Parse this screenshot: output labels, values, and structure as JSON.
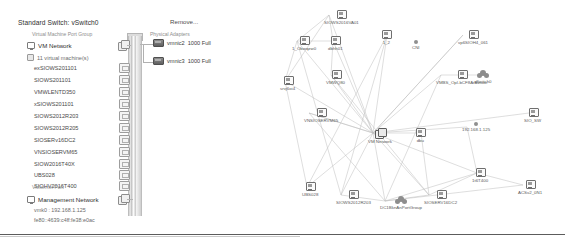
{
  "window": {
    "product": "vSphere Client Networking View"
  },
  "switch_panel": {
    "title": "Standard Switch: vSwitch0",
    "remove_label": "Remove...",
    "vm_port_group_caption": "Virtual Machine Port Group",
    "vmkernel_port_caption": "VMkernel Port",
    "physical_adapters_caption": "Physical Adapters",
    "port_groups": [
      {
        "name": "VM Network",
        "vm_count_label": "11 virtual machine(s)",
        "vms": [
          "exSIOWS201101",
          "SIOWS201101",
          "VMWLENTD350",
          "xSIOWS201101",
          "SIOWS2012R203",
          "SIOWS2012R205",
          "SIOSERv16DC2",
          "VNSIOSERVM65",
          "SIOW2016T40X",
          "UBS028",
          "SIOHV2016T400"
        ]
      }
    ],
    "vmkernel": {
      "name": "Management Network",
      "ipv4": "vmk0 : 192.168.1.125",
      "ipv6": "fe80::4639:c4ff:fe38:e0ac"
    },
    "physical_adapters": [
      {
        "name": "vmnic2",
        "speed": "1000 Full"
      },
      {
        "name": "vmnic3",
        "speed": "1000 Full"
      }
    ]
  },
  "network_map": {
    "nodes": [
      {
        "id": "n1",
        "label": "SIOWS2016VA01",
        "type": "vm",
        "x": 48,
        "y": 10
      },
      {
        "id": "n2",
        "label": "1_Obwqzw0",
        "type": "vm",
        "x": 16,
        "y": 36
      },
      {
        "id": "n3",
        "label": "dbhh01",
        "type": "vm",
        "x": 52,
        "y": 36
      },
      {
        "id": "n4",
        "label": "1_2",
        "type": "vm",
        "x": 106,
        "y": 30
      },
      {
        "id": "n5",
        "label": "CNI",
        "type": "dot",
        "x": 136,
        "y": 40
      },
      {
        "id": "n6",
        "label": "vp6SIOH4_061",
        "type": "vm",
        "x": 182,
        "y": 30
      },
      {
        "id": "n7",
        "label": "srvj6oi4",
        "type": "vm",
        "x": 4,
        "y": 76
      },
      {
        "id": "n8",
        "label": "VMWQ80",
        "type": "vm",
        "x": 50,
        "y": 70
      },
      {
        "id": "n9",
        "label": "VMBS_OpI-bCF8ArAviuwi",
        "type": "vm",
        "x": 160,
        "y": 70
      },
      {
        "id": "n10",
        "label": "vSwitch0",
        "type": "cloud",
        "x": 198,
        "y": 70
      },
      {
        "id": "n11",
        "label": "VM Network",
        "type": "hub",
        "x": 92,
        "y": 128
      },
      {
        "id": "n12",
        "label": "dbu",
        "type": "vm",
        "x": 140,
        "y": 128
      },
      {
        "id": "n13",
        "label": "192.168.1.125",
        "type": "dot",
        "x": 186,
        "y": 122
      },
      {
        "id": "n14",
        "label": "SIO_SW",
        "type": "vm",
        "x": 248,
        "y": 108
      },
      {
        "id": "n15",
        "label": "VNSIOSERVM65",
        "type": "vm",
        "x": 28,
        "y": 108
      },
      {
        "id": "n16",
        "label": "UBS028",
        "type": "vm",
        "x": 26,
        "y": 182
      },
      {
        "id": "n17",
        "label": "SIOWS2012R203",
        "type": "vm",
        "x": 60,
        "y": 190
      },
      {
        "id": "n18",
        "label": "DC1BknAnPortGroup",
        "type": "cloud",
        "x": 104,
        "y": 196
      },
      {
        "id": "n19",
        "label": "SIOSERV16DC2",
        "type": "vm",
        "x": 148,
        "y": 190
      },
      {
        "id": "n20",
        "label": "1t6T400",
        "type": "vm",
        "x": 196,
        "y": 168
      },
      {
        "id": "n21",
        "label": "ACSv2_0N1",
        "type": "vm",
        "x": 242,
        "y": 180
      }
    ],
    "edges": [
      [
        "n1",
        "n2"
      ],
      [
        "n1",
        "n3"
      ],
      [
        "n1",
        "n11"
      ],
      [
        "n1",
        "n7"
      ],
      [
        "n2",
        "n3"
      ],
      [
        "n2",
        "n11"
      ],
      [
        "n2",
        "n7"
      ],
      [
        "n2",
        "n17"
      ],
      [
        "n3",
        "n11"
      ],
      [
        "n3",
        "n8"
      ],
      [
        "n4",
        "n11"
      ],
      [
        "n4",
        "n17"
      ],
      [
        "n4",
        "n16"
      ],
      [
        "n6",
        "n11"
      ],
      [
        "n7",
        "n11"
      ],
      [
        "n7",
        "n16"
      ],
      [
        "n8",
        "n11"
      ],
      [
        "n8",
        "n19"
      ],
      [
        "n9",
        "n11"
      ],
      [
        "n9",
        "n18"
      ],
      [
        "n10",
        "n9"
      ],
      [
        "n11",
        "n12"
      ],
      [
        "n11",
        "n13"
      ],
      [
        "n11",
        "n14"
      ],
      [
        "n11",
        "n15"
      ],
      [
        "n11",
        "n16"
      ],
      [
        "n11",
        "n17"
      ],
      [
        "n11",
        "n18"
      ],
      [
        "n11",
        "n19"
      ],
      [
        "n11",
        "n20"
      ],
      [
        "n11",
        "n6"
      ],
      [
        "n15",
        "n11"
      ],
      [
        "n15",
        "n18"
      ],
      [
        "n17",
        "n18"
      ],
      [
        "n18",
        "n19"
      ],
      [
        "n18",
        "n20"
      ],
      [
        "n19",
        "n20"
      ],
      [
        "n20",
        "n21"
      ],
      [
        "n18",
        "n21"
      ],
      [
        "n12",
        "n19"
      ],
      [
        "n13",
        "n20"
      ]
    ]
  }
}
